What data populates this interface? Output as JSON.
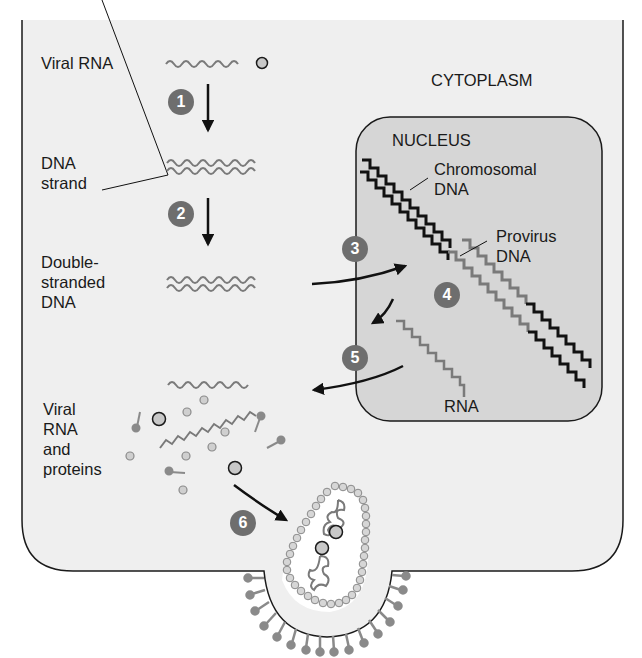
{
  "diagram": {
    "region_labels": {
      "cytoplasm": "CYTOPLASM",
      "nucleus": "NUCLEUS"
    },
    "left_labels": [
      {
        "id": "viral-rna",
        "text": "Viral RNA"
      },
      {
        "id": "dna-strand",
        "text": "DNA\nstrand"
      },
      {
        "id": "double-stranded-dna",
        "text": "Double-\nstranded\nDNA"
      },
      {
        "id": "viral-rna-proteins",
        "text": "Viral\nRNA\nand\nproteins"
      }
    ],
    "nucleus_labels": {
      "chromosomal_dna": "Chromosomal\nDNA",
      "provirus_dna": "Provirus\nDNA",
      "rna": "RNA"
    },
    "steps": [
      {
        "number": "1",
        "from": "Viral RNA",
        "to": "DNA strand"
      },
      {
        "number": "2",
        "from": "DNA strand",
        "to": "Double-stranded DNA"
      },
      {
        "number": "3",
        "from": "Double-stranded DNA",
        "to": "Nucleus (provirus integration)"
      },
      {
        "number": "4",
        "from": "Provirus DNA",
        "to": "RNA"
      },
      {
        "number": "5",
        "from": "RNA (nucleus)",
        "to": "Cytoplasm"
      },
      {
        "number": "6",
        "from": "Viral RNA and proteins",
        "to": "Budding virion"
      }
    ],
    "colors": {
      "cell_fill": "#efefef",
      "nucleus_fill": "#d6d6d6",
      "outline": "#1a1a1a",
      "viral_strand": "#7a7a7a",
      "badge": "#6e6e6e",
      "protein_fill": "#c8c8c8"
    }
  }
}
